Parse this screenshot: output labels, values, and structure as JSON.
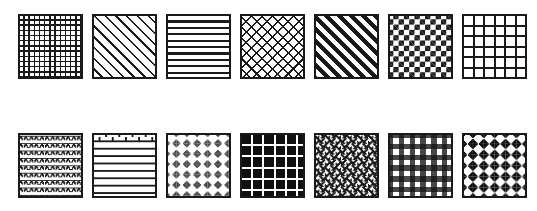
{
  "sheet": {
    "title": "Seamless Pattern Swatch Set",
    "background_color": "#ffffff",
    "ink_color": "#1a1a1a",
    "accent_color": "#4d4d4d",
    "columns": 7,
    "rows": 2,
    "swatch_count": 14
  },
  "rows": [
    {
      "row_label": "Row 1",
      "swatches": [
        {
          "index": "1",
          "name": "fine-square-grid",
          "label": "Fine square grid",
          "pattern_class": "p-fine-grid",
          "fg": "#1a1a1a",
          "bg": "#ffffff",
          "cell_px": "5.2"
        },
        {
          "index": "2",
          "name": "thin-diagonal-stripes",
          "label": "Thin diagonal stripes",
          "pattern_class": "p-diagonal-thin",
          "fg": "#1a1a1a",
          "bg": "#ffffff",
          "cell_px": "7.6"
        },
        {
          "index": "3",
          "name": "horizontal-stripes",
          "label": "Horizontal stripes",
          "pattern_class": "p-horizontal-stripes",
          "fg": "#1a1a1a",
          "bg": "#ffffff",
          "cell_px": "6.4"
        },
        {
          "index": "4",
          "name": "diagonal-crosshatch",
          "label": "Diagonal crosshatch",
          "pattern_class": "p-crosshatch",
          "fg": "#1a1a1a",
          "bg": "#ffffff",
          "cell_px": "7.4"
        },
        {
          "index": "5",
          "name": "bold-diagonal-stripes",
          "label": "Bold diagonal stripes",
          "pattern_class": "p-diagonal-bold",
          "fg": "#1a1a1a",
          "bg": "#ffffff",
          "cell_px": "8.6"
        },
        {
          "index": "6",
          "name": "checkerboard",
          "label": "Checkerboard",
          "pattern_class": "p-checkerboard",
          "fg": "#1a1a1a",
          "bg": "#ffffff",
          "cell_px": "5.3"
        },
        {
          "index": "7",
          "name": "coarse-square-grid",
          "label": "Coarse square grid",
          "pattern_class": "p-coarse-grid",
          "fg": "#1a1a1a",
          "bg": "#ffffff",
          "cell_px": "10.6"
        }
      ]
    },
    {
      "row_label": "Row 2",
      "swatches": [
        {
          "index": "8",
          "name": "fish-scale-scallop",
          "label": "Fish scale scallop",
          "pattern_class": "p-scallop",
          "fg": "#1a1a1a",
          "bg": "#ffffff",
          "cell_px": "7.4"
        },
        {
          "index": "9",
          "name": "running-bond-brick",
          "label": "Running bond brick",
          "pattern_class": "p-brick",
          "fg": "#1a1a1a",
          "bg": "#ffffff",
          "cell_px": "7.4"
        },
        {
          "index": "10",
          "name": "argyle-diamond-lattice",
          "label": "Argyle diamond lattice",
          "pattern_class": "p-argyle",
          "fg": "#4d4d4d",
          "bg": "#ffffff",
          "cell_px": "10.4"
        },
        {
          "index": "11",
          "name": "inverted-grid",
          "label": "Inverted grid",
          "pattern_class": "p-inverted-grid",
          "fg": "#ffffff",
          "bg": "#101010",
          "cell_px": "11.2"
        },
        {
          "index": "12",
          "name": "basketweave",
          "label": "Basketweave",
          "pattern_class": "p-basketweave",
          "fg": "#1a1a1a",
          "bg": "#ffffff",
          "cell_px": "10.8"
        },
        {
          "index": "13",
          "name": "gingham-plaid",
          "label": "Gingham plaid",
          "pattern_class": "p-gingham",
          "fg": "#141414",
          "bg": "#ffffff",
          "cell_px": "10.8"
        },
        {
          "index": "14",
          "name": "bold-diamond-dots",
          "label": "Bold diamond dots",
          "pattern_class": "p-diamonds",
          "fg": "#101010",
          "bg": "#ffffff",
          "cell_px": "10.9"
        }
      ]
    }
  ]
}
